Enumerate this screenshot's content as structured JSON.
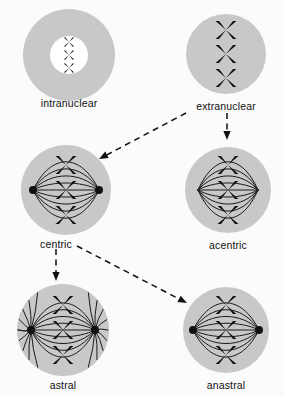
{
  "figure": {
    "background_color": "#fbfbfb",
    "cell_fill_color": "#c8c8c8",
    "nucleus_fill_color": "#ffffff",
    "chromosome_color": "#111111",
    "centrosome_color": "#111111",
    "spindle_color": "#1a1a1a",
    "arrow_color": "#111111",
    "label_color": "#111111"
  },
  "cells": [
    {
      "id": "intranuclear",
      "label": "intranuclear",
      "cx": 69,
      "cy": 55,
      "r": 46,
      "label_x": 69,
      "label_y": 97,
      "has_nucleus": true,
      "nucleus_r": 19,
      "chromosome_count": 3,
      "chromosome_size": 9,
      "chromosome_spacing": 13,
      "has_spindle": false,
      "has_centrosomes": false,
      "has_asters": false
    },
    {
      "id": "extranuclear",
      "label": "extranuclear",
      "cx": 226,
      "cy": 54,
      "r": 40,
      "label_x": 226,
      "label_y": 100,
      "has_nucleus": false,
      "nucleus_r": 0,
      "chromosome_count": 3,
      "chromosome_size": 18,
      "chromosome_spacing": 24,
      "has_spindle": false,
      "has_centrosomes": false,
      "has_asters": false
    },
    {
      "id": "centric",
      "label": "centric",
      "cx": 66,
      "cy": 190,
      "r": 45,
      "label_x": 56,
      "label_y": 238,
      "has_nucleus": false,
      "nucleus_r": 0,
      "chromosome_count": 3,
      "chromosome_size": 18,
      "chromosome_spacing": 25,
      "has_spindle": true,
      "spindle_half_width": 33,
      "spindle_half_height": 26,
      "spindle_fiber_count": 9,
      "has_centrosomes": true,
      "centrosome_r": 4,
      "has_asters": false
    },
    {
      "id": "acentric",
      "label": "acentric",
      "cx": 228,
      "cy": 190,
      "r": 43,
      "label_x": 228,
      "label_y": 239,
      "has_nucleus": false,
      "nucleus_r": 0,
      "chromosome_count": 3,
      "chromosome_size": 18,
      "chromosome_spacing": 25,
      "has_spindle": true,
      "spindle_half_width": 30,
      "spindle_half_height": 26,
      "spindle_fiber_count": 9,
      "has_centrosomes": false,
      "centrosome_r": 0,
      "has_asters": false
    },
    {
      "id": "astral",
      "label": "astral",
      "cx": 63,
      "cy": 330,
      "r": 46,
      "label_x": 63,
      "label_y": 379,
      "has_nucleus": false,
      "nucleus_r": 0,
      "chromosome_count": 3,
      "chromosome_size": 18,
      "chromosome_spacing": 25,
      "has_spindle": true,
      "spindle_half_width": 32,
      "spindle_half_height": 25,
      "spindle_fiber_count": 9,
      "has_centrosomes": true,
      "centrosome_r": 4,
      "has_asters": true,
      "aster_ray_count": 17
    },
    {
      "id": "anastral",
      "label": "anastral",
      "cx": 226,
      "cy": 330,
      "r": 43,
      "label_x": 226,
      "label_y": 379,
      "has_nucleus": false,
      "nucleus_r": 0,
      "chromosome_count": 3,
      "chromosome_size": 18,
      "chromosome_spacing": 25,
      "has_spindle": true,
      "spindle_half_width": 33,
      "spindle_half_height": 25,
      "spindle_fiber_count": 9,
      "has_centrosomes": true,
      "centrosome_r": 4,
      "has_asters": false
    }
  ],
  "arrows": [
    {
      "id": "extranuclear-to-centric",
      "from": "extranuclear",
      "to": "centric",
      "x1": 186,
      "y1": 113,
      "x2": 99,
      "y2": 159,
      "style": "dashed"
    },
    {
      "id": "extranuclear-to-acentric",
      "from": "extranuclear",
      "to": "acentric",
      "x1": 227,
      "y1": 113,
      "x2": 227,
      "y2": 140,
      "style": "dashed"
    },
    {
      "id": "centric-to-astral",
      "from": "centric",
      "to": "astral",
      "x1": 56,
      "y1": 249,
      "x2": 56,
      "y2": 281,
      "style": "dashed"
    },
    {
      "id": "centric-to-anastral",
      "from": "centric",
      "to": "anastral",
      "x1": 77,
      "y1": 246,
      "x2": 187,
      "y2": 303,
      "style": "dashed"
    }
  ]
}
